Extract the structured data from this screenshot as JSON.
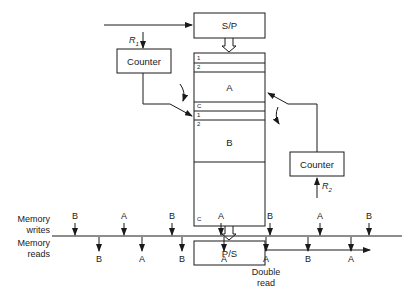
{
  "blocks": {
    "sp": "S/P",
    "ps": "P/S",
    "counter_left": "Counter",
    "counter_right": "Counter",
    "r1": "R",
    "r1_sub": "1",
    "r2": "R",
    "r2_sub": "2"
  },
  "memory": {
    "buffer_a": {
      "label": "A",
      "rows": [
        "1",
        "2",
        "C"
      ]
    },
    "buffer_b": {
      "label": "B",
      "rows": [
        "1",
        "2",
        "C"
      ]
    }
  },
  "timeline": {
    "writes_label_1": "Memory",
    "writes_label_2": "writes",
    "reads_label_1": "Memory",
    "reads_label_2": "reads",
    "writes": [
      "B",
      "A",
      "B",
      "A",
      "B",
      "A",
      "B"
    ],
    "reads": [
      "B",
      "A",
      "B",
      "A",
      "A",
      "B",
      "A"
    ],
    "annotation_1": "Double",
    "annotation_2": "read"
  },
  "colors": {
    "stroke": "#1a1a1a",
    "background": "#ffffff"
  }
}
